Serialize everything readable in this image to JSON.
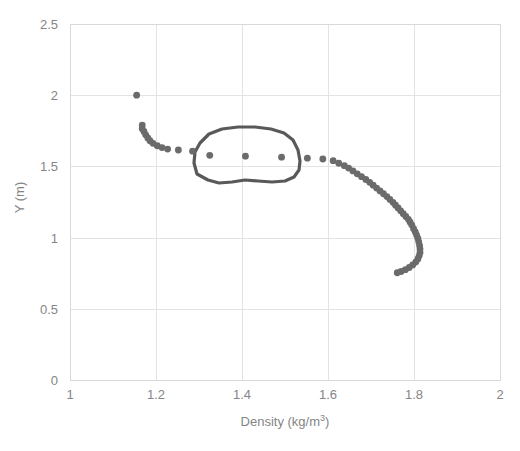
{
  "chart_data": {
    "type": "scatter",
    "title": "",
    "xlabel": "Density (kg/m3)",
    "xlabel_base": "Density (kg/m",
    "xlabel_sup": "3",
    "xlabel_tail": ")",
    "ylabel": "Y (m)",
    "xlim": [
      1,
      2
    ],
    "ylim": [
      0,
      2.5
    ],
    "xticks": [
      "1",
      "1.2",
      "1.4",
      "1.6",
      "1.8",
      "2"
    ],
    "xtick_values": [
      1,
      1.2,
      1.4,
      1.6,
      1.8,
      2
    ],
    "yticks": [
      "0",
      "0.5",
      "1",
      "1.5",
      "2",
      "2.5"
    ],
    "ytick_values": [
      0,
      0.5,
      1,
      1.5,
      2,
      2.5
    ],
    "grid": true,
    "legend": "none",
    "marker_color": "#6b6b6b",
    "marker_size": 6,
    "grid_color": "#e6e6e6",
    "series": [
      {
        "name": "Density profile",
        "points": [
          [
            1.155,
            2.0
          ],
          [
            1.168,
            1.79
          ],
          [
            1.168,
            1.765
          ],
          [
            1.172,
            1.745
          ],
          [
            1.176,
            1.722
          ],
          [
            1.181,
            1.7
          ],
          [
            1.186,
            1.68
          ],
          [
            1.193,
            1.662
          ],
          [
            1.203,
            1.645
          ],
          [
            1.214,
            1.632
          ],
          [
            1.227,
            1.622
          ],
          [
            1.252,
            1.615
          ],
          [
            1.285,
            1.607
          ],
          [
            1.325,
            1.578
          ],
          [
            1.408,
            1.572
          ],
          [
            1.492,
            1.565
          ],
          [
            1.552,
            1.558
          ],
          [
            1.588,
            1.552
          ],
          [
            1.612,
            1.54
          ],
          [
            1.625,
            1.522
          ],
          [
            1.638,
            1.505
          ],
          [
            1.648,
            1.488
          ],
          [
            1.658,
            1.468
          ],
          [
            1.668,
            1.448
          ],
          [
            1.678,
            1.428
          ],
          [
            1.688,
            1.408
          ],
          [
            1.697,
            1.388
          ],
          [
            1.705,
            1.368
          ],
          [
            1.713,
            1.348
          ],
          [
            1.721,
            1.328
          ],
          [
            1.729,
            1.308
          ],
          [
            1.737,
            1.288
          ],
          [
            1.744,
            1.268
          ],
          [
            1.751,
            1.248
          ],
          [
            1.757,
            1.228
          ],
          [
            1.763,
            1.208
          ],
          [
            1.769,
            1.188
          ],
          [
            1.775,
            1.168
          ],
          [
            1.781,
            1.148
          ],
          [
            1.787,
            1.128
          ],
          [
            1.791,
            1.108
          ],
          [
            1.795,
            1.088
          ],
          [
            1.799,
            1.062
          ],
          [
            1.803,
            1.04
          ],
          [
            1.806,
            1.018
          ],
          [
            1.809,
            0.995
          ],
          [
            1.811,
            0.97
          ],
          [
            1.813,
            0.945
          ],
          [
            1.814,
            0.92
          ],
          [
            1.814,
            0.895
          ],
          [
            1.812,
            0.872
          ],
          [
            1.809,
            0.85
          ],
          [
            1.804,
            0.828
          ],
          [
            1.797,
            0.808
          ],
          [
            1.789,
            0.79
          ],
          [
            1.78,
            0.775
          ],
          [
            1.77,
            0.762
          ],
          [
            1.761,
            0.753
          ]
        ]
      }
    ],
    "annotations": [
      {
        "name": "hand-drawn-circle",
        "shape": "freehand-outline",
        "color": "#595959",
        "encloses_points": [
          [
            1.325,
            1.578
          ],
          [
            1.408,
            1.572
          ],
          [
            1.492,
            1.565
          ]
        ],
        "x_range": [
          1.29,
          1.52
        ],
        "y_range": [
          1.45,
          1.73
        ]
      }
    ]
  }
}
